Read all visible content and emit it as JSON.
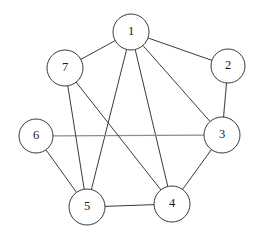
{
  "diagram": {
    "type": "undirected-graph",
    "width": 257,
    "height": 237,
    "background_color": "#ffffff",
    "default_edge_color": "#3a3a3a",
    "default_edge_width": 1.0,
    "node_fill_color": "#ffffff",
    "node_stroke_color": "#3a3a3a",
    "node_stroke_width": 1.0,
    "node_radius": 18,
    "label_color": "#1a1a1a",
    "node_count": 7,
    "edge_count": 12,
    "nodes": [
      {
        "id": "1",
        "label": "1",
        "cx": 131,
        "cy": 32,
        "r": 18
      },
      {
        "id": "2",
        "label": "2",
        "cx": 228,
        "cy": 66,
        "r": 17
      },
      {
        "id": "3",
        "label": "3",
        "cx": 222,
        "cy": 135,
        "r": 18
      },
      {
        "id": "4",
        "label": "4",
        "cx": 172,
        "cy": 204,
        "r": 18
      },
      {
        "id": "5",
        "label": "5",
        "cx": 87,
        "cy": 207,
        "r": 18
      },
      {
        "id": "6",
        "label": "6",
        "cx": 36,
        "cy": 136,
        "r": 17
      },
      {
        "id": "7",
        "label": "7",
        "cx": 65,
        "cy": 68,
        "r": 18
      }
    ],
    "edges": [
      {
        "id": "e-1-7",
        "source": "1",
        "target": "7",
        "color": "#3a3a3a",
        "width": 1.0
      },
      {
        "id": "e-1-2",
        "source": "1",
        "target": "2",
        "color": "#3a3a3a",
        "width": 1.0
      },
      {
        "id": "e-1-3",
        "source": "1",
        "target": "3",
        "color": "#3a3a3a",
        "width": 1.0
      },
      {
        "id": "e-1-4",
        "source": "1",
        "target": "4",
        "color": "#3a3a3a",
        "width": 1.0
      },
      {
        "id": "e-1-5",
        "source": "1",
        "target": "5",
        "color": "#3a3a3a",
        "width": 1.0
      },
      {
        "id": "e-2-3",
        "source": "2",
        "target": "3",
        "color": "#555555",
        "width": 1.2
      },
      {
        "id": "e-3-4",
        "source": "3",
        "target": "4",
        "color": "#3a3a3a",
        "width": 1.0
      },
      {
        "id": "e-3-6",
        "source": "3",
        "target": "6",
        "color": "#8d8d8d",
        "width": 1.1
      },
      {
        "id": "e-4-5",
        "source": "4",
        "target": "5",
        "color": "#3a3a3a",
        "width": 1.0
      },
      {
        "id": "e-4-7",
        "source": "4",
        "target": "7",
        "color": "#3a3a3a",
        "width": 1.0
      },
      {
        "id": "e-5-6",
        "source": "5",
        "target": "6",
        "color": "#3a3a3a",
        "width": 1.0
      },
      {
        "id": "e-5-7",
        "source": "5",
        "target": "7",
        "color": "#3a3a3a",
        "width": 1.0
      }
    ]
  }
}
